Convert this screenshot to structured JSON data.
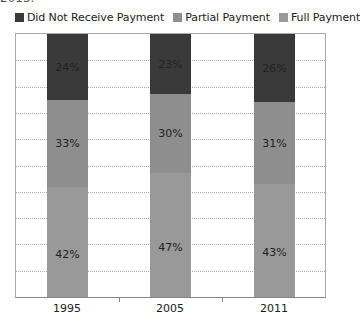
{
  "cut_title": "2013.",
  "legend": [
    {
      "label": "Did Not Receive Payment",
      "color": "#3a3a3a"
    },
    {
      "label": "Partial Payment",
      "color": "#8e8e8e"
    },
    {
      "label": "Full Payment",
      "color": "#999999"
    }
  ],
  "chart_data": {
    "type": "bar",
    "stacked": true,
    "normalized_100": true,
    "title": "",
    "xlabel": "",
    "ylabel": "",
    "ylim": [
      0,
      100
    ],
    "grid": true,
    "legend_position": "top",
    "categories": [
      "1995",
      "2005",
      "2011"
    ],
    "series": [
      {
        "name": "Full Payment",
        "color": "#999999",
        "values": [
          42,
          47,
          43
        ],
        "labels": [
          "42%",
          "47%",
          "43%"
        ]
      },
      {
        "name": "Partial Payment",
        "color": "#8e8e8e",
        "values": [
          33,
          30,
          31
        ],
        "labels": [
          "33%",
          "30%",
          "31%"
        ]
      },
      {
        "name": "Did Not Receive Payment",
        "color": "#3a3a3a",
        "values": [
          24,
          23,
          26
        ],
        "labels": [
          "24%",
          "23%",
          "26%"
        ]
      }
    ]
  }
}
